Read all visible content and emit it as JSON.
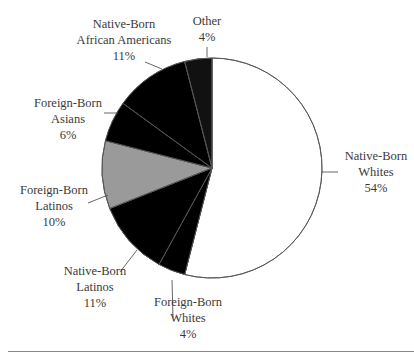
{
  "chart_data": {
    "type": "pie",
    "title": "",
    "slices": [
      {
        "label": "Native-Born Whites",
        "value": 54,
        "pattern": "blank"
      },
      {
        "label": "Foreign-Born Whites",
        "value": 4,
        "pattern": "crosshatch"
      },
      {
        "label": "Native-Born Latinos",
        "value": 11,
        "pattern": "horizontal-lines"
      },
      {
        "label": "Foreign-Born Latinos",
        "value": 10,
        "pattern": "gray-fill"
      },
      {
        "label": "Foreign-Born Asians",
        "value": 6,
        "pattern": "diagonal-lines"
      },
      {
        "label": "Native-Born African Americans",
        "value": 11,
        "pattern": "dots"
      },
      {
        "label": "Other",
        "value": 4,
        "pattern": "black-fill"
      }
    ],
    "start_angle": "12 o'clock, clockwise",
    "legend": "none (direct labels with leader lines)"
  },
  "labels": {
    "nbw": {
      "line1": "Native-Born",
      "line2": "Whites",
      "pct": "54%"
    },
    "fbw": {
      "line1": "Foreign-Born",
      "line2": "Whites",
      "pct": "4%"
    },
    "nbl": {
      "line1": "Native-Born",
      "line2": "Latinos",
      "pct": "11%"
    },
    "fbl": {
      "line1": "Foreign-Born",
      "line2": "Latinos",
      "pct": "10%"
    },
    "fba": {
      "line1": "Foreign-Born",
      "line2": "Asians",
      "pct": "6%"
    },
    "nbaa": {
      "line1": "Native-Born",
      "line2": "African Americans",
      "pct": "11%"
    },
    "other": {
      "line1": "Other",
      "pct": "4%"
    }
  },
  "colors": {
    "stroke": "#555555",
    "gray": "#9a9a9a",
    "black": "#111111"
  }
}
